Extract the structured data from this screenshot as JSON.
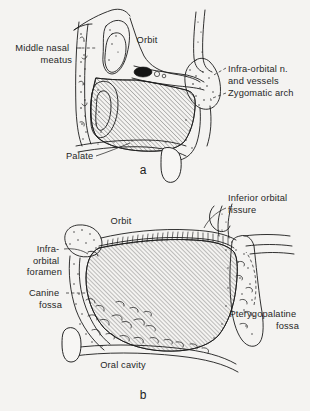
{
  "figure": {
    "background_color": "#f4f3f1",
    "ink_color": "#1b1b1b",
    "panels": [
      {
        "letter": "a",
        "letter_x": 143,
        "letter_y": 174,
        "labels": [
          {
            "id": "middle-nasal-meatus",
            "lines": [
              "Middle nasal",
              "meatus"
            ],
            "x": 72,
            "y": 51,
            "align": "end",
            "leader": "dashed"
          },
          {
            "id": "orbit",
            "lines": [
              "Orbit"
            ],
            "x": 147,
            "y": 43,
            "align": "middle",
            "leader": "none"
          },
          {
            "id": "infra-orbital-nerve-and-vessels",
            "lines": [
              "Infra-orbital n.",
              "and vessels"
            ],
            "x": 228,
            "y": 72,
            "align": "start",
            "leader": "dashed"
          },
          {
            "id": "zygomatic-arch",
            "lines": [
              "Zygomatic arch"
            ],
            "x": 228,
            "y": 96,
            "align": "start",
            "leader": "dashed"
          },
          {
            "id": "palate",
            "lines": [
              "Palate"
            ],
            "x": 66,
            "y": 159,
            "align": "start",
            "leader": "solid"
          }
        ]
      },
      {
        "letter": "b",
        "letter_x": 143,
        "letter_y": 399,
        "labels": [
          {
            "id": "inferior-orbital-fissure",
            "lines": [
              "Inferior orbital",
              "fissure"
            ],
            "x": 228,
            "y": 201,
            "align": "start",
            "leader": "solid"
          },
          {
            "id": "orbit",
            "lines": [
              "Orbit"
            ],
            "x": 121,
            "y": 224,
            "align": "middle",
            "leader": "none"
          },
          {
            "id": "infra-orbital-foramen",
            "lines": [
              "Infra-",
              "orbital",
              "foramen"
            ],
            "x": 62,
            "y": 252,
            "align": "end",
            "leader": "solid"
          },
          {
            "id": "canine-fossa",
            "lines": [
              "Canine",
              "fossa"
            ],
            "x": 62,
            "y": 296,
            "align": "end",
            "leader": "dashed"
          },
          {
            "id": "pterygopalatine-fossa",
            "lines": [
              "Pterygopalatine",
              "fossa"
            ],
            "x": 299,
            "y": 317,
            "align": "end",
            "leader": "dashed"
          },
          {
            "id": "oral-cavity",
            "lines": [
              "Oral cavity"
            ],
            "x": 123,
            "y": 368,
            "align": "middle",
            "leader": "none"
          }
        ]
      }
    ]
  }
}
